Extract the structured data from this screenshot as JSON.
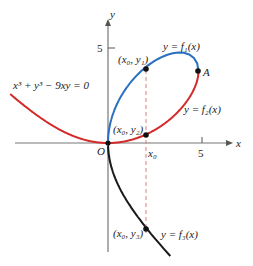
{
  "diagram": {
    "equation": "x³ + y³ − 9xy = 0",
    "axes": {
      "x_label": "x",
      "y_label": "y",
      "origin_label": "O",
      "x_tick_label": "5",
      "y_tick_label": "5",
      "x0_label": "x₀"
    },
    "branches": [
      {
        "label": "y = f₁(x)",
        "color": "#2a6fc0"
      },
      {
        "label": "y = f₂(x)",
        "color": "#d32a2a"
      },
      {
        "label": "y = f₃(x)",
        "color": "#1a1a1a"
      }
    ],
    "points": [
      {
        "label": "(x₀, y₁)"
      },
      {
        "label": "(x₀, y₂)"
      },
      {
        "label": "(x₀, y₃)"
      },
      {
        "label": "A"
      }
    ],
    "colors": {
      "axis": "#777777",
      "dashed": "#d88080",
      "point": "#111111"
    }
  }
}
